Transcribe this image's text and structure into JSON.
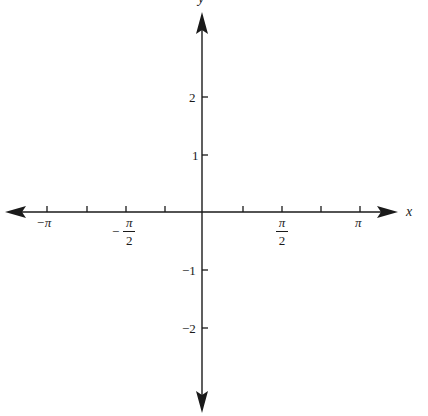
{
  "diagram": {
    "type": "coordinate-axes",
    "colors": {
      "axis": "#1a1a1a",
      "background": "#ffffff",
      "text": "#1a1a1a"
    },
    "x_axis": {
      "label": "x",
      "ticks": [
        {
          "value": "-pi",
          "px": 47
        },
        {
          "value": "-3pi/4",
          "px": 87
        },
        {
          "value": "-pi/2",
          "px": 126
        },
        {
          "value": "-pi/4",
          "px": 165
        },
        {
          "value": "pi/4",
          "px": 243
        },
        {
          "value": "pi/2",
          "px": 282
        },
        {
          "value": "3pi/4",
          "px": 321
        },
        {
          "value": "pi",
          "px": 360
        }
      ],
      "labels": {
        "neg_pi": "−π",
        "neg_half_pi_sign": "−",
        "neg_half_pi_num": "π",
        "neg_half_pi_den": "2",
        "half_pi_num": "π",
        "half_pi_den": "2",
        "pi": "π"
      }
    },
    "y_axis": {
      "label": "y",
      "ticks": [
        {
          "value": 2,
          "label": "2",
          "px": 97
        },
        {
          "value": 1,
          "label": "1",
          "px": 155
        },
        {
          "value": -1,
          "label": "−1",
          "px": 270
        },
        {
          "value": -2,
          "label": "−2",
          "px": 328
        }
      ]
    }
  }
}
